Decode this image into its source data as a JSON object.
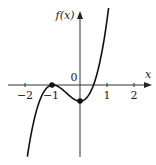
{
  "chart_data": {
    "type": "line",
    "title": "",
    "xlabel": "x",
    "ylabel": "f(x)",
    "origin_label": "0",
    "x_ticks": [
      -2,
      -1,
      1,
      2
    ],
    "x_tick_labels": [
      "−2",
      "−1",
      "1",
      "2"
    ],
    "xlim": [
      -2.9,
      2.8
    ],
    "ylim": [
      -2.7,
      2.7
    ],
    "grid": false,
    "legend": null,
    "function": "f(x) = a(x+1)^2 (x - 0.5), cubic with double root at x=-1 and local minimum at x=0",
    "series": [
      {
        "name": "f(x)",
        "x": [
          -1.95,
          -1.75,
          -1.5,
          -1.25,
          -1.0,
          -0.75,
          -0.5,
          -0.25,
          0.0,
          0.25,
          0.5,
          0.75,
          1.0,
          1.05
        ],
        "y": [
          -2.65,
          -1.39,
          -0.6,
          -0.14,
          0.0,
          -0.09,
          -0.3,
          -0.51,
          -0.6,
          -0.47,
          0.0,
          0.91,
          2.4,
          2.72
        ]
      }
    ],
    "highlighted_points": [
      {
        "x": -1,
        "y": 0,
        "label": "local maximum"
      },
      {
        "x": 0,
        "y": -0.6,
        "label": "local minimum"
      }
    ],
    "colors": {
      "curve": "#111111",
      "axis": "#333333"
    }
  }
}
